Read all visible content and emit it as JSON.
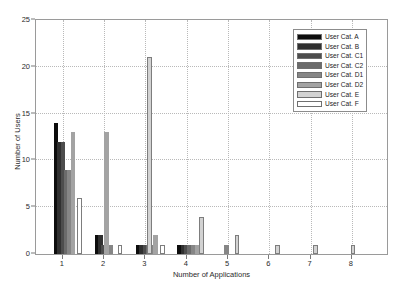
{
  "chart_data": {
    "type": "bar",
    "title": "",
    "xlabel": "Number of Applications",
    "ylabel": "Number of Users",
    "xlim": [
      0.35,
      8.85
    ],
    "ylim": [
      0,
      25
    ],
    "yticks": [
      0,
      5,
      10,
      15,
      20,
      25
    ],
    "xticks": [
      1,
      2,
      3,
      4,
      5,
      6,
      7,
      8
    ],
    "grid": true,
    "legend_position": "upper right",
    "legend_entries": [
      "User Cat. A",
      "User Cat. B",
      "User Cat. C1",
      "User Cat. C2",
      "User Cat. D1",
      "User Cat. D2",
      "User Cat. E",
      "User Cat. F"
    ],
    "series_colors": [
      "#0d0d0d",
      "#303030",
      "#4d4d4d",
      "#6b6b6b",
      "#868686",
      "#a3a3a3",
      "#d2d2d2",
      "#ffffff"
    ],
    "categories": [
      1,
      2,
      3,
      4,
      5,
      6,
      7,
      8
    ],
    "series": [
      {
        "name": "User Cat. A",
        "values": [
          14,
          2,
          1,
          1,
          0,
          0,
          0,
          0
        ]
      },
      {
        "name": "User Cat. B",
        "values": [
          12,
          2,
          1,
          1,
          0,
          0,
          0,
          0
        ]
      },
      {
        "name": "User Cat. C1",
        "values": [
          12,
          1,
          1,
          1,
          0,
          0,
          0,
          0
        ]
      },
      {
        "name": "User Cat. C2",
        "values": [
          9,
          1,
          1,
          1,
          0,
          0,
          0,
          0
        ]
      },
      {
        "name": "User Cat. D1",
        "values": [
          9,
          1,
          1,
          1,
          1,
          0,
          0,
          0
        ]
      },
      {
        "name": "User Cat. D2",
        "values": [
          13,
          13,
          1,
          2,
          1,
          0,
          0,
          0
        ]
      },
      {
        "name": "User Cat. E",
        "values": [
          0,
          0,
          21,
          4,
          2,
          1,
          1,
          1
        ]
      },
      {
        "name": "User Cat. F",
        "values": [
          6,
          1,
          1,
          0,
          0,
          0,
          0,
          0
        ]
      }
    ],
    "bars": [
      {
        "x": 0.83,
        "height": 14,
        "color_index": 0
      },
      {
        "x": 0.92,
        "height": 12,
        "color_index": 1
      },
      {
        "x": 1.0,
        "height": 12,
        "color_index": 2
      },
      {
        "x": 1.08,
        "height": 9,
        "color_index": 3
      },
      {
        "x": 1.16,
        "height": 9,
        "color_index": 4
      },
      {
        "x": 1.25,
        "height": 13,
        "color_index": 5
      },
      {
        "x": 1.4,
        "height": 6,
        "color_index": 7
      },
      {
        "x": 1.83,
        "height": 2,
        "color_index": 0
      },
      {
        "x": 1.91,
        "height": 2,
        "color_index": 1
      },
      {
        "x": 1.99,
        "height": 1,
        "color_index": 2
      },
      {
        "x": 2.07,
        "height": 1,
        "color_index": 3
      },
      {
        "x": 2.15,
        "height": 1,
        "color_index": 4
      },
      {
        "x": 2.06,
        "height": 13,
        "color_index": 5
      },
      {
        "x": 2.38,
        "height": 1,
        "color_index": 7
      },
      {
        "x": 2.83,
        "height": 1,
        "color_index": 0
      },
      {
        "x": 2.91,
        "height": 1,
        "color_index": 1
      },
      {
        "x": 2.99,
        "height": 1,
        "color_index": 2
      },
      {
        "x": 3.07,
        "height": 1,
        "color_index": 3
      },
      {
        "x": 3.15,
        "height": 1,
        "color_index": 4
      },
      {
        "x": 3.25,
        "height": 2,
        "color_index": 5
      },
      {
        "x": 3.1,
        "height": 21,
        "color_index": 6
      },
      {
        "x": 3.42,
        "height": 1,
        "color_index": 7
      },
      {
        "x": 3.83,
        "height": 1,
        "color_index": 0
      },
      {
        "x": 3.91,
        "height": 1,
        "color_index": 1
      },
      {
        "x": 3.99,
        "height": 1,
        "color_index": 2
      },
      {
        "x": 4.07,
        "height": 1,
        "color_index": 3
      },
      {
        "x": 4.16,
        "height": 1,
        "color_index": 4
      },
      {
        "x": 4.25,
        "height": 1,
        "color_index": 5
      },
      {
        "x": 4.36,
        "height": 4,
        "color_index": 6
      },
      {
        "x": 4.97,
        "height": 1,
        "color_index": 4
      },
      {
        "x": 5.22,
        "height": 2,
        "color_index": 6
      },
      {
        "x": 6.2,
        "height": 1,
        "color_index": 6
      },
      {
        "x": 7.12,
        "height": 1,
        "color_index": 6
      },
      {
        "x": 8.03,
        "height": 1,
        "color_index": 6
      }
    ]
  }
}
